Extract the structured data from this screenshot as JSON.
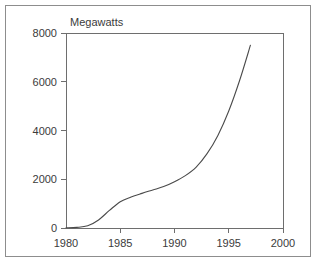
{
  "chart_data": {
    "type": "line",
    "title": "",
    "subtitle": "",
    "xlabel": "",
    "ylabel": "Megawatts",
    "ylabel_position": "above-axis",
    "xlim": [
      1980,
      2000
    ],
    "ylim": [
      0,
      8000
    ],
    "grid": false,
    "legend": null,
    "background_color": "#ffffff",
    "line_color": "#4a4a4a",
    "axis_color": "#6e6e6e",
    "text_color": "#3b3b3b",
    "x_ticks": [
      1980,
      1985,
      1990,
      1995,
      2000
    ],
    "x_tick_labels": [
      "1980",
      "1985",
      "1990",
      "1995",
      "2000"
    ],
    "y_ticks": [
      0,
      2000,
      4000,
      6000,
      8000
    ],
    "y_tick_labels": [
      "0",
      "2000",
      "4000",
      "6000",
      "8000"
    ],
    "series": [
      {
        "name": "Installed capacity",
        "x": [
          1980,
          1981,
          1982,
          1983,
          1984,
          1985,
          1986,
          1987,
          1988,
          1989,
          1990,
          1991,
          1992,
          1993,
          1994,
          1995,
          1996,
          1997
        ],
        "values": [
          10,
          25,
          90,
          330,
          720,
          1080,
          1270,
          1420,
          1560,
          1700,
          1900,
          2150,
          2500,
          3050,
          3800,
          4800,
          6050,
          7500
        ]
      }
    ],
    "annotations": []
  },
  "figure": {
    "frame_visible": true,
    "plot_area": {
      "left": 66,
      "top": 33,
      "right": 283,
      "bottom": 228
    }
  }
}
